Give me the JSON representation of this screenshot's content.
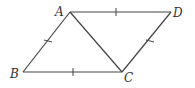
{
  "diagram": {
    "type": "geometry",
    "vertices": {
      "A": {
        "label": "A",
        "x": 70,
        "y": 12
      },
      "B": {
        "label": "B",
        "x": 23,
        "y": 72
      },
      "C": {
        "label": "C",
        "x": 122,
        "y": 72
      },
      "D": {
        "label": "D",
        "x": 171,
        "y": 12
      }
    },
    "segments": [
      {
        "from": "A",
        "to": "D",
        "tick_marks": 1
      },
      {
        "from": "A",
        "to": "B",
        "tick_marks": 1
      },
      {
        "from": "B",
        "to": "C",
        "tick_marks": 1
      },
      {
        "from": "C",
        "to": "D",
        "tick_marks": 1
      },
      {
        "from": "A",
        "to": "C",
        "tick_marks": 0
      }
    ],
    "colors": {
      "line": "#444444",
      "text": "#333333",
      "background": "#ffffff"
    }
  }
}
